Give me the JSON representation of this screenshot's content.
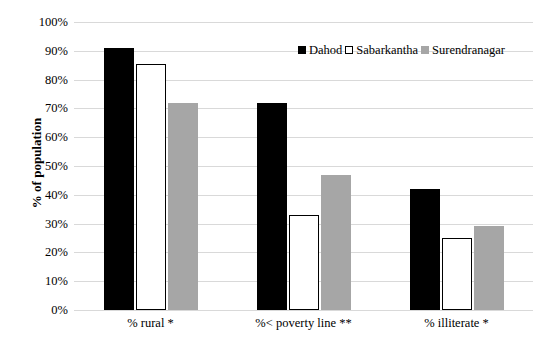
{
  "chart_data": {
    "type": "bar",
    "title": "",
    "subtitle": "",
    "xlabel": "",
    "ylabel": "% of population",
    "ylim": [
      0,
      100
    ],
    "ytick_labels": [
      "100%",
      "90%",
      "80%",
      "70%",
      "60%",
      "50%",
      "40%",
      "30%",
      "20%",
      "10%",
      "0%"
    ],
    "ytick_values": [
      100,
      90,
      80,
      70,
      60,
      50,
      40,
      30,
      20,
      10,
      0
    ],
    "grid": true,
    "legend_position": "top-right",
    "categories": [
      "% rural *",
      "%< poverty line **",
      "% illiterate *"
    ],
    "series": [
      {
        "name": "Dahod",
        "color": "#000000",
        "border_color": "#000000",
        "values": [
          91,
          72,
          42
        ]
      },
      {
        "name": "Sabarkantha",
        "color": "#ffffff",
        "border_color": "#000000",
        "values": [
          85.5,
          33,
          25
        ]
      },
      {
        "name": "Surendranagar",
        "color": "#a6a6a6",
        "border_color": "#a6a6a6",
        "values": [
          72,
          47,
          29
        ]
      }
    ]
  },
  "axis": {
    "y_title": "% of population"
  },
  "legend": {
    "items": [
      {
        "label": "Dahod"
      },
      {
        "label": "Sabarkantha"
      },
      {
        "label": "Surendranagar"
      }
    ]
  }
}
